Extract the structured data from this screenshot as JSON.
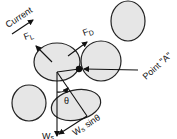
{
  "diagram": {
    "labels": {
      "current": "Current",
      "lift_force": "F",
      "lift_sub": "L",
      "drag_force": "F",
      "drag_sub": "D",
      "point_a": "Point \"A\"",
      "angle": "θ",
      "weight": "W",
      "weight_sub": "s",
      "weight_component": "W",
      "weight_component_sub": "s",
      "weight_component_suffix": " sinθ"
    },
    "colors": {
      "grain_fill": "#e6e6e6",
      "stroke": "#222222",
      "background": "#ffffff"
    },
    "grains": [
      {
        "id": "central-grain",
        "cx": 57,
        "cy": 62,
        "rx": 23,
        "ry": 19
      },
      {
        "id": "right-grain",
        "cx": 101,
        "cy": 61,
        "rx": 20,
        "ry": 20
      },
      {
        "id": "top-right-grain",
        "cx": 128,
        "cy": 21,
        "rx": 17,
        "ry": 20
      },
      {
        "id": "lower-left-grain",
        "cx": 29,
        "cy": 103,
        "rx": 17,
        "ry": 18
      },
      {
        "id": "lower-grain",
        "cx": 76,
        "cy": 105,
        "rx": 25,
        "ry": 15
      }
    ]
  }
}
